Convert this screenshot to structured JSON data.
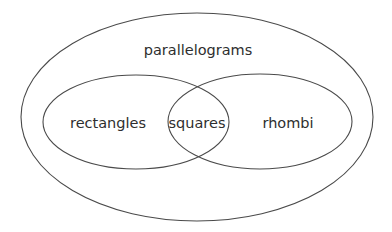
{
  "diagram": {
    "colors": {
      "background": "#ffffff",
      "stroke": "#4a4a4a",
      "text": "#2e2e2e"
    },
    "sets": {
      "outer": {
        "label": "parallelograms",
        "cx": 197,
        "cy": 117,
        "rx": 176,
        "ry": 104,
        "label_x": 198,
        "label_y": 55
      },
      "left": {
        "label": "rectangles",
        "cx": 136,
        "cy": 122,
        "rx": 93,
        "ry": 47,
        "label_x": 108,
        "label_y": 128
      },
      "right": {
        "label": "rhombi",
        "cx": 260,
        "cy": 121.5,
        "rx": 92,
        "ry": 47.5,
        "label_x": 288,
        "label_y": 128
      },
      "intersection": {
        "label": "squares",
        "label_x": 197,
        "label_y": 128
      }
    }
  }
}
